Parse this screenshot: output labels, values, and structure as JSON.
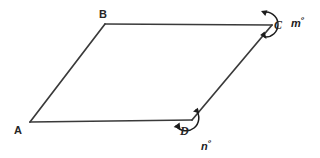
{
  "figure": {
    "canvas": {
      "width": 320,
      "height": 158,
      "background": "#ffffff"
    },
    "stroke_color": "#3a3a3a",
    "stroke_width": 1.6,
    "shape": {
      "type": "parallelogram",
      "vertices": [
        {
          "name": "A",
          "x": 30,
          "y": 122
        },
        {
          "name": "B",
          "x": 105,
          "y": 24
        },
        {
          "name": "C",
          "x": 272,
          "y": 25
        },
        {
          "name": "D",
          "x": 192,
          "y": 120
        }
      ],
      "edges": [
        "AB",
        "BC",
        "CD",
        "DA"
      ]
    },
    "vertex_labels": [
      {
        "text": "A",
        "x": 14,
        "y": 125,
        "style": "sans"
      },
      {
        "text": "B",
        "x": 99,
        "y": 9,
        "style": "sans"
      },
      {
        "text": "C",
        "x": 274,
        "y": 19,
        "style": "serif-italic"
      },
      {
        "text": "D",
        "x": 180,
        "y": 125,
        "style": "serif-italic"
      }
    ],
    "angle_markers": [
      {
        "at_vertex": "C",
        "label": "m",
        "degree_symbol": "º",
        "label_x": 291,
        "label_y": 16,
        "arc_kind": "reflex-double-arrow"
      },
      {
        "at_vertex": "D",
        "label": "n",
        "degree_symbol": "º",
        "label_x": 201,
        "label_y": 139,
        "arc_kind": "reflex-double-arrow"
      }
    ]
  }
}
